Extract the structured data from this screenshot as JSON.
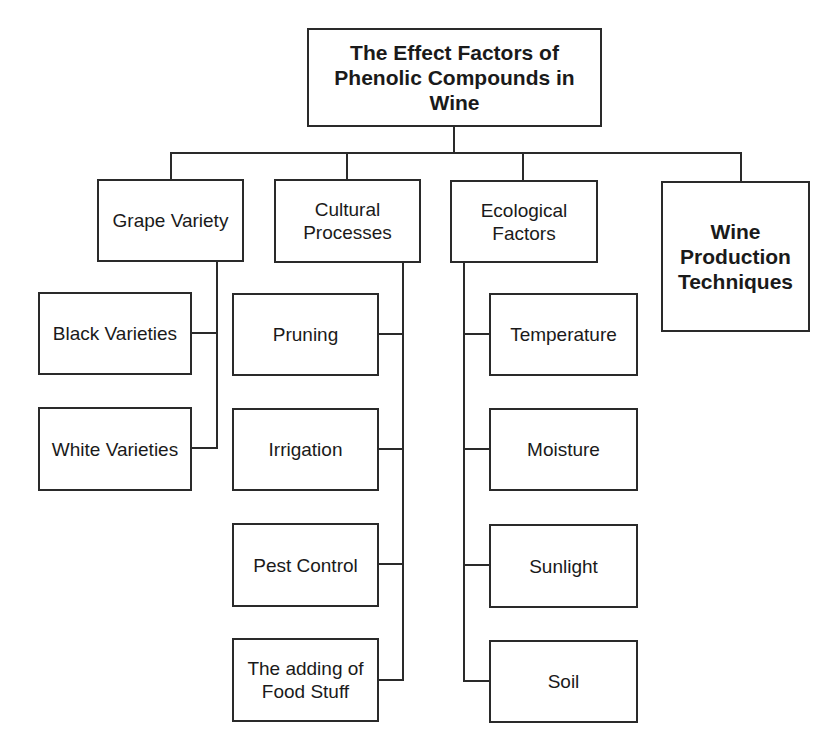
{
  "diagram": {
    "root": {
      "label": "The Effect Factors of Phenolic Compounds in Wine"
    },
    "categories": [
      {
        "label": "Grape Variety",
        "children": [
          "Black Varieties",
          "White Varieties"
        ]
      },
      {
        "label": "Cultural Processes",
        "children": [
          "Pruning",
          "Irrigation",
          "Pest Control",
          "The adding of Food Stuff"
        ]
      },
      {
        "label": "Ecological Factors",
        "children": [
          "Temperature",
          "Moisture",
          "Sunlight",
          "Soil"
        ]
      },
      {
        "label": "Wine Production Techniques",
        "children": []
      }
    ]
  }
}
